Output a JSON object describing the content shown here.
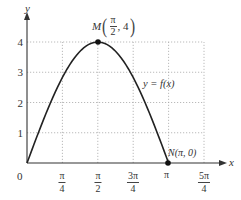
{
  "chart_data": {
    "type": "line",
    "title": "",
    "xlabel": "x",
    "ylabel": "y",
    "function_label": "y = f(x)",
    "x_tick_labels": [
      "0",
      "π/4",
      "π/2",
      "3π/4",
      "π",
      "5π/4"
    ],
    "x_tick_values": [
      0,
      0.7854,
      1.5708,
      2.3562,
      3.1416,
      3.927
    ],
    "y_tick_labels": [
      "1",
      "2",
      "3",
      "4"
    ],
    "y_tick_values": [
      1,
      2,
      3,
      4
    ],
    "xlim": [
      0,
      3.927
    ],
    "ylim": [
      0,
      4
    ],
    "grid": true,
    "grid_style": "dotted",
    "series": [
      {
        "name": "y = f(x)",
        "x": [
          0,
          0.3927,
          0.7854,
          1.1781,
          1.5708,
          1.9635,
          2.3562,
          2.7489,
          3.1416
        ],
        "values": [
          0,
          1.53,
          2.83,
          3.7,
          4.0,
          3.7,
          2.83,
          1.53,
          0
        ]
      }
    ],
    "annotations": [
      {
        "name": "M",
        "label": "M(π/2, 4)",
        "x": 1.5708,
        "y": 4
      },
      {
        "name": "N",
        "label": "N(π, 0)",
        "x": 3.1416,
        "y": 0
      }
    ],
    "colors": {
      "curve": "#222222",
      "axis": "#333333",
      "grid": "#aaaaaa",
      "text": "#333333"
    }
  },
  "labels": {
    "x_axis": "x",
    "y_axis": "y",
    "origin": "0",
    "function": "y = f(x)",
    "m_letter": "M",
    "m_num": "π",
    "m_den": "2",
    "m_rest": ", 4",
    "n_label": "N(π, 0)",
    "xticks": [
      {
        "num": "π",
        "den": "4"
      },
      {
        "num": "π",
        "den": "2"
      },
      {
        "num": "3π",
        "den": "4"
      },
      {
        "single": "π"
      },
      {
        "num": "5π",
        "den": "4"
      }
    ],
    "yticks": [
      "1",
      "2",
      "3",
      "4"
    ]
  }
}
